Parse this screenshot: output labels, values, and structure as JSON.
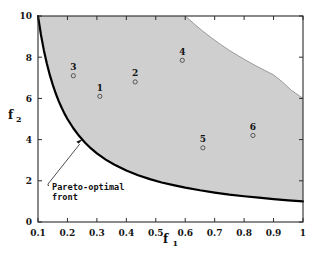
{
  "chart_data": {
    "type": "scatter",
    "title": "",
    "xlabel": "f_1",
    "ylabel": "f_2",
    "xlim": [
      0.1,
      1
    ],
    "ylim": [
      0,
      10
    ],
    "grid": false,
    "legend": "none",
    "xticks": [
      "0.1",
      "0.2",
      "0.3",
      "0.4",
      "0.5",
      "0.6",
      "0.7",
      "0.8",
      "0.9",
      "1"
    ],
    "xtick_values": [
      0.1,
      0.2,
      0.3,
      0.4,
      0.5,
      0.6,
      0.7,
      0.8,
      0.9,
      1.0
    ],
    "yticks": [
      "0",
      "2",
      "4",
      "6",
      "8",
      "10"
    ],
    "ytick_values": [
      0,
      2,
      4,
      6,
      8,
      10
    ],
    "points": [
      {
        "label": "1",
        "x": 0.31,
        "y": 6.1
      },
      {
        "label": "2",
        "x": 0.43,
        "y": 6.8
      },
      {
        "label": "3",
        "x": 0.22,
        "y": 7.1
      },
      {
        "label": "4",
        "x": 0.59,
        "y": 7.85
      },
      {
        "label": "5",
        "x": 0.66,
        "y": 3.6
      },
      {
        "label": "6",
        "x": 0.83,
        "y": 4.2
      }
    ],
    "curves": [
      {
        "name": "pareto-optimal-front",
        "description": "lower boundary f2 = 1/f1",
        "color": "#000000",
        "width": 2.2,
        "x": [
          0.1,
          0.11,
          0.12,
          0.13,
          0.14,
          0.15,
          0.16,
          0.17,
          0.18,
          0.19,
          0.2,
          0.22,
          0.24,
          0.26,
          0.28,
          0.3,
          0.33,
          0.36,
          0.4,
          0.44,
          0.48,
          0.52,
          0.56,
          0.6,
          0.65,
          0.7,
          0.75,
          0.8,
          0.85,
          0.9,
          0.95,
          1.0
        ],
        "y": [
          10.0,
          9.09,
          8.33,
          7.69,
          7.14,
          6.67,
          6.25,
          5.88,
          5.56,
          5.26,
          5.0,
          4.55,
          4.17,
          3.85,
          3.57,
          3.33,
          3.03,
          2.78,
          2.5,
          2.27,
          2.08,
          1.92,
          1.79,
          1.67,
          1.54,
          1.43,
          1.33,
          1.25,
          1.18,
          1.11,
          1.05,
          1.0
        ]
      },
      {
        "name": "upper-boundary",
        "description": "upper boundary of feasible objective space",
        "color": "#9a9a9a",
        "width": 1.0,
        "x": [
          0.6,
          0.63,
          0.66,
          0.69,
          0.72,
          0.75,
          0.78,
          0.81,
          0.84,
          0.87,
          0.9,
          0.93,
          0.96,
          1.0
        ],
        "y": [
          10.0,
          9.62,
          9.26,
          8.93,
          8.62,
          8.33,
          8.07,
          7.82,
          7.58,
          7.36,
          7.14,
          6.8,
          6.4,
          6.0
        ]
      }
    ],
    "region": {
      "name": "feasible-objective-space",
      "fill": "#cfcfcf"
    },
    "annotation": {
      "line1": "Pareto-optimal",
      "line2": "front",
      "target_x": 0.25,
      "target_y": 4.0
    },
    "colors": {
      "region_fill": "#cfcfcf",
      "front_line": "#000000",
      "upper_line": "#9a9a9a",
      "axis": "#2b2b2b",
      "marker_edge": "#4a4a4a",
      "background": "#ffffff"
    }
  }
}
